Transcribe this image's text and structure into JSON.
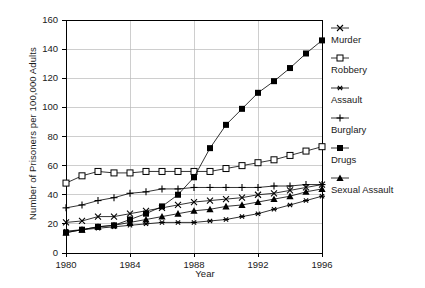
{
  "chart_data": {
    "type": "line",
    "title": "",
    "xlabel": "Year",
    "ylabel": "Number of Prisoners per 100,000 Adults",
    "xlim": [
      1980,
      1996
    ],
    "ylim": [
      0,
      160
    ],
    "ytick_labels": [
      "0",
      "20",
      "40",
      "60",
      "80",
      "100",
      "120",
      "140",
      "160"
    ],
    "ytick_values": [
      0,
      20,
      40,
      60,
      80,
      100,
      120,
      140,
      160
    ],
    "xtick_labels": [
      "1980",
      "1984",
      "1988",
      "1992",
      "1996"
    ],
    "xtick_values": [
      1980,
      1984,
      1988,
      1992,
      1996
    ],
    "grid": true,
    "legend_position": "right",
    "x": [
      1980,
      1981,
      1982,
      1983,
      1984,
      1985,
      1986,
      1987,
      1988,
      1989,
      1990,
      1991,
      1992,
      1993,
      1994,
      1995,
      1996
    ],
    "series": [
      {
        "name": "Murder",
        "marker": "x-cross",
        "values": [
          21,
          22,
          25,
          25,
          27,
          29,
          31,
          33,
          35,
          36,
          37,
          38,
          40,
          41,
          43,
          45,
          47
        ]
      },
      {
        "name": "Robbery",
        "marker": "open-square",
        "values": [
          48,
          53,
          56,
          55,
          55,
          56,
          56,
          56,
          56,
          56,
          58,
          60,
          62,
          64,
          67,
          70,
          73
        ]
      },
      {
        "name": "Assault",
        "marker": "asterisk",
        "values": [
          15,
          16,
          17,
          18,
          19,
          20,
          21,
          21,
          21,
          22,
          23,
          25,
          27,
          30,
          33,
          36,
          39
        ]
      },
      {
        "name": "Burglary",
        "marker": "plus",
        "values": [
          31,
          33,
          36,
          38,
          41,
          42,
          44,
          44,
          45,
          45,
          45,
          45,
          45,
          46,
          46,
          47,
          47
        ]
      },
      {
        "name": "Drugs",
        "marker": "filled-square",
        "values": [
          14,
          16,
          18,
          19,
          23,
          27,
          32,
          40,
          52,
          72,
          88,
          99,
          110,
          118,
          127,
          137,
          146
        ]
      },
      {
        "name": "Sexual Assault",
        "marker": "filled-triangle",
        "values": [
          14,
          16,
          18,
          19,
          21,
          23,
          25,
          27,
          29,
          30,
          32,
          33,
          35,
          37,
          39,
          42,
          44
        ]
      }
    ]
  }
}
